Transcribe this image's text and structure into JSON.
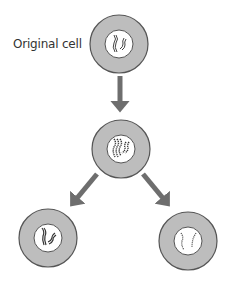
{
  "diagram": {
    "label": "Original cell",
    "colors": {
      "cytoplasm": "#bdbdbd",
      "outline": "#555555",
      "nucleus": "#ffffff",
      "arrow": "#6e6e6e",
      "chromosome": "#444444"
    },
    "nodes": [
      {
        "id": "original-cell",
        "cx": 119,
        "cy": 44,
        "r": 29,
        "stage": "original"
      },
      {
        "id": "replicated-cell",
        "cx": 121,
        "cy": 149,
        "r": 29,
        "stage": "replicated"
      },
      {
        "id": "daughter-cell-left",
        "cx": 48,
        "cy": 238,
        "r": 29,
        "stage": "daughter"
      },
      {
        "id": "daughter-cell-right",
        "cx": 188,
        "cy": 241,
        "r": 29,
        "stage": "daughter"
      }
    ],
    "edges": [
      {
        "from": "original-cell",
        "to": "replicated-cell"
      },
      {
        "from": "replicated-cell",
        "to": "daughter-cell-left"
      },
      {
        "from": "replicated-cell",
        "to": "daughter-cell-right"
      }
    ]
  }
}
